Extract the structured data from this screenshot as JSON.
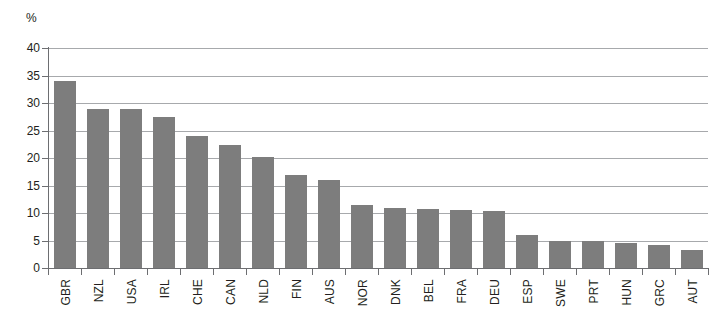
{
  "chart_data": {
    "type": "bar",
    "title": "",
    "subtitle": "",
    "xlabel": "",
    "ylabel": "",
    "unit_label": "%",
    "ylim": [
      0,
      40
    ],
    "yticks": [
      0,
      5,
      10,
      15,
      20,
      25,
      30,
      35,
      40
    ],
    "ytick_labels": [
      "0",
      "5",
      "10",
      "15",
      "20",
      "25",
      "30",
      "35",
      "40"
    ],
    "grid": true,
    "grid_axis": "y",
    "legend": null,
    "legend_position": "none",
    "bar_color": "#7d7d7d",
    "axis_color": "#6d6e71",
    "grid_color": "#a7a9ac",
    "text_color": "#231f20",
    "categories": [
      "GBR",
      "NZL",
      "USA",
      "IRL",
      "CHE",
      "CAN",
      "NLD",
      "FIN",
      "AUS",
      "NOR",
      "DNK",
      "BEL",
      "FRA",
      "DEU",
      "ESP",
      "SWE",
      "PRT",
      "HUN",
      "GRC",
      "AUT"
    ],
    "values": [
      34.0,
      29.0,
      29.0,
      27.5,
      24.0,
      22.4,
      20.2,
      17.0,
      16.0,
      11.4,
      11.0,
      10.7,
      10.5,
      10.4,
      6.0,
      5.0,
      5.0,
      4.6,
      4.2,
      3.3
    ],
    "series": [
      {
        "name": "",
        "values": [
          34.0,
          29.0,
          29.0,
          27.5,
          24.0,
          22.4,
          20.2,
          17.0,
          16.0,
          11.4,
          11.0,
          10.7,
          10.5,
          10.4,
          6.0,
          5.0,
          5.0,
          4.6,
          4.2,
          3.3
        ]
      }
    ]
  }
}
